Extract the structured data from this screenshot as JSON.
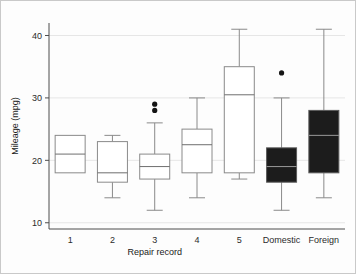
{
  "chart_data": {
    "type": "box",
    "title": "",
    "xlabel": "Repair record",
    "ylabel": "Mileage (mpg)",
    "categories": [
      "1",
      "2",
      "3",
      "4",
      "5",
      "Domestic",
      "Foreign"
    ],
    "ylim": [
      9,
      42
    ],
    "yticks": [
      10,
      20,
      30,
      40
    ],
    "yticklabels": [
      "10",
      "20",
      "30",
      "40"
    ],
    "grid": "horizontal-faint",
    "legend": "none",
    "boxes": [
      {
        "category": "1",
        "fill": "open",
        "whisker_low": 18,
        "q1": 18,
        "median": 21,
        "q3": 24,
        "whisker_high": 24,
        "outliers": []
      },
      {
        "category": "2",
        "fill": "open",
        "whisker_low": 14,
        "q1": 16.5,
        "median": 18,
        "q3": 23,
        "whisker_high": 24,
        "outliers": []
      },
      {
        "category": "3",
        "fill": "open",
        "whisker_low": 12,
        "q1": 17,
        "median": 19,
        "q3": 21,
        "whisker_high": 26,
        "outliers": [
          28,
          29
        ]
      },
      {
        "category": "4",
        "fill": "open",
        "whisker_low": 14,
        "q1": 18,
        "median": 22.5,
        "q3": 25,
        "whisker_high": 30,
        "outliers": []
      },
      {
        "category": "5",
        "fill": "open",
        "whisker_low": 17,
        "q1": 18,
        "median": 30.5,
        "q3": 35,
        "whisker_high": 41,
        "outliers": []
      },
      {
        "category": "Domestic",
        "fill": "solid",
        "whisker_low": 12,
        "q1": 16.5,
        "median": 19,
        "q3": 22,
        "whisker_high": 30,
        "outliers": [
          34
        ]
      },
      {
        "category": "Foreign",
        "fill": "solid",
        "whisker_low": 14,
        "q1": 18,
        "median": 24,
        "q3": 28,
        "whisker_high": 41,
        "outliers": []
      }
    ]
  },
  "colors": {
    "background": "#ffffff",
    "frame": "#c9c9c9",
    "axis": "#4d4d4d",
    "grid": "#e6e6e6",
    "box_open_fill": "#ffffff",
    "box_open_stroke": "#8a8a8a",
    "box_solid_fill": "#1c1c1c",
    "whisker": "#8a8a8a",
    "outlier": "#141414",
    "text": "#1a1a1a"
  },
  "geometry": {
    "plot_left": 48,
    "plot_right": 344,
    "plot_top": 22,
    "plot_bottom": 228,
    "y_value_at_top": 42,
    "y_value_at_bottom": 9,
    "box_half_width": 15,
    "cap_half_width": 8,
    "outlier_radius": 2.6
  }
}
